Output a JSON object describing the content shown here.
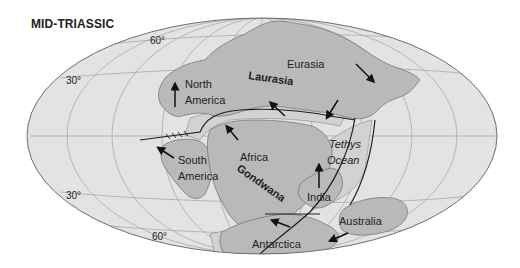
{
  "title": "MID-TRIASSIC",
  "colors": {
    "ocean": "#e3e3e3",
    "land": "#b9b9b9",
    "shelf": "#d2d2d2",
    "graticule": "#a9a9a9",
    "outline": "#6e6e6e",
    "boundary": "#1e1e1e",
    "arrow": "#111111",
    "background": "#ffffff"
  },
  "latitude_labels": [
    {
      "text": "60°",
      "position": "upper-left"
    },
    {
      "text": "30°",
      "position": "upper-left"
    },
    {
      "text": "30°",
      "position": "lower-left"
    },
    {
      "text": "60°",
      "position": "lower-left"
    }
  ],
  "supercontinents": [
    {
      "name": "Laurasia",
      "style": "bold"
    },
    {
      "name": "Gondwana",
      "style": "bold"
    }
  ],
  "landmasses": [
    {
      "name": "North America",
      "lines": [
        "North",
        "America"
      ],
      "arrow_direction": "north"
    },
    {
      "name": "Eurasia",
      "lines": [
        "Eurasia"
      ],
      "arrow_direction": "southeast"
    },
    {
      "name": "South America",
      "lines": [
        "South",
        "America"
      ],
      "arrow_direction": "northwest"
    },
    {
      "name": "Africa",
      "lines": [
        "Africa"
      ],
      "arrow_direction": "northwest"
    },
    {
      "name": "India",
      "lines": [
        "India"
      ],
      "arrow_direction": "north"
    },
    {
      "name": "Australia",
      "lines": [
        "Australia"
      ],
      "arrow_direction": "southwest"
    },
    {
      "name": "Antarctica",
      "lines": [
        "Antarctica"
      ],
      "arrow_direction": "west"
    }
  ],
  "ocean_labels": [
    {
      "name": "Tethys Ocean",
      "lines": [
        "Tethys",
        "Ocean"
      ],
      "style": "italic"
    }
  ],
  "additional_arrows": [
    {
      "location": "southern Eurasia",
      "direction": "northwest"
    },
    {
      "location": "southeast Eurasia near Tethys",
      "direction": "southwest"
    }
  ]
}
